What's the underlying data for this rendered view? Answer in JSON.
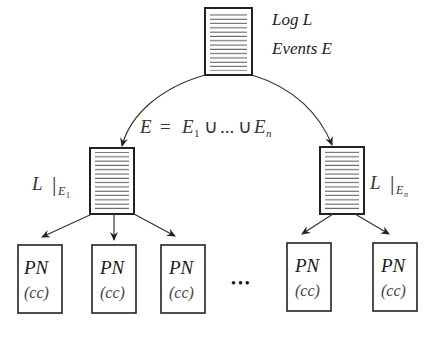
{
  "diagram": {
    "type": "process-mining-decomposition",
    "root": {
      "label_line1": "Log L",
      "label_line2": "Events E",
      "box": {
        "x": 205,
        "y": 8,
        "w": 47,
        "h": 67
      }
    },
    "split_label": {
      "lhs": "E",
      "eq": "=",
      "e1": "E",
      "e1_sub": "1",
      "union1": "∪",
      "dots": "...",
      "union2": "∪",
      "en": "E",
      "en_sub": "n"
    },
    "sublogs": [
      {
        "id": "left",
        "label": "L",
        "bar": "|",
        "sub": "E",
        "subsub": "1",
        "box": {
          "x": 90,
          "y": 148,
          "w": 44,
          "h": 66
        }
      },
      {
        "id": "right",
        "label": "L",
        "bar": "|",
        "sub": "E",
        "subsub": "n",
        "box": {
          "x": 320,
          "y": 147,
          "w": 44,
          "h": 67
        }
      }
    ],
    "models": [
      {
        "title": "PN",
        "subtitle": "(cc)",
        "box": {
          "x": 18,
          "y": 245,
          "w": 44,
          "h": 68
        }
      },
      {
        "title": "PN",
        "subtitle": "(cc)",
        "box": {
          "x": 92,
          "y": 245,
          "w": 44,
          "h": 68
        }
      },
      {
        "title": "PN",
        "subtitle": "(cc)",
        "box": {
          "x": 161,
          "y": 245,
          "w": 44,
          "h": 68
        }
      },
      {
        "title": "PN",
        "subtitle": "(cc)",
        "box": {
          "x": 287,
          "y": 243,
          "w": 44,
          "h": 68
        }
      },
      {
        "title": "PN",
        "subtitle": "(cc)",
        "box": {
          "x": 373,
          "y": 243,
          "w": 44,
          "h": 68
        }
      }
    ],
    "ellipsis": "•••",
    "colors": {
      "stroke": "#222222",
      "lines": "#555555",
      "text": "#222222"
    }
  }
}
